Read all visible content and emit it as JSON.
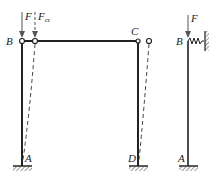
{
  "diagram": {
    "type": "structural-frame-buckling",
    "left_frame": {
      "nodes": {
        "top_left": "B",
        "top_right": "C",
        "bottom_left": "A",
        "bottom_right": "D"
      },
      "loads": [
        {
          "label": "F"
        },
        {
          "label_main": "F",
          "label_sub": "cr"
        }
      ],
      "deformed_shape": "dashed sway"
    },
    "right_model": {
      "nodes": {
        "top": "B",
        "bottom": "A"
      },
      "load": "F",
      "support_top": "spring to wall"
    },
    "colors": {
      "line": "#222222",
      "dashed": "#444444"
    }
  }
}
